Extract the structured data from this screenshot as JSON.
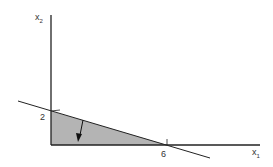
{
  "diagram": {
    "type": "linear-constraint-region",
    "axes": {
      "x_label": "x",
      "x_sub": "1",
      "y_label": "x",
      "y_sub": "2"
    },
    "intercepts": {
      "y_intercept_label": "2",
      "x_intercept_label": "6"
    },
    "colors": {
      "region_fill": "#b4b4b4",
      "line": "#222222"
    }
  }
}
